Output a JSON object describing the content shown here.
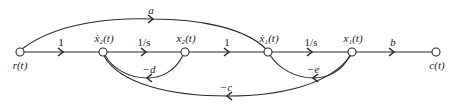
{
  "diagram": {
    "type": "signal-flow-graph",
    "nodes": [
      {
        "id": "r",
        "label": "r(t)",
        "x": 20,
        "y": 52,
        "label_pos": "below"
      },
      {
        "id": "x2dot",
        "label": "ẋ₂(t)",
        "x": 103,
        "y": 52,
        "label_pos": "above"
      },
      {
        "id": "x2",
        "label": "x₂(t)",
        "x": 185,
        "y": 52,
        "label_pos": "above"
      },
      {
        "id": "x1dot",
        "label": "ẋ₁(t)",
        "x": 268,
        "y": 52,
        "label_pos": "above"
      },
      {
        "id": "x1",
        "label": "x₁(t)",
        "x": 352,
        "y": 52,
        "label_pos": "above"
      },
      {
        "id": "c",
        "label": "c(t)",
        "x": 436,
        "y": 52,
        "label_pos": "below"
      }
    ],
    "forward_branches": [
      {
        "from": "r",
        "to": "x2dot",
        "gain": "1"
      },
      {
        "from": "x2dot",
        "to": "x2",
        "gain": "1/s"
      },
      {
        "from": "x2",
        "to": "x1dot",
        "gain": "1"
      },
      {
        "from": "x1dot",
        "to": "x1",
        "gain": "1/s"
      },
      {
        "from": "x1",
        "to": "c",
        "gain": "b"
      }
    ],
    "feedforward_branches": [
      {
        "from": "r",
        "to": "x1dot",
        "gain": "a"
      }
    ],
    "feedback_branches": [
      {
        "from": "x2",
        "to": "x2dot",
        "gain": "−d"
      },
      {
        "from": "x1",
        "to": "x1dot",
        "gain": "−e"
      },
      {
        "from": "x1",
        "to": "x2dot",
        "gain": "−c"
      }
    ]
  },
  "labels": {
    "node_r": "r(t)",
    "node_x2dot": "ẋ₂(t)",
    "node_x2": "x₂(t)",
    "node_x1dot": "ẋ₁(t)",
    "node_x1": "x₁(t)",
    "node_c": "c(t)",
    "gain_r_x2dot": "1",
    "gain_x2dot_x2": "1/s",
    "gain_x2_x1dot": "1",
    "gain_x1dot_x1": "1/s",
    "gain_x1_c": "b",
    "gain_a": "a",
    "gain_d": "−d",
    "gain_e": "−e",
    "gain_c": "−c"
  },
  "colors": {
    "stroke": "#2a2a2a",
    "background": "#ffffff"
  }
}
